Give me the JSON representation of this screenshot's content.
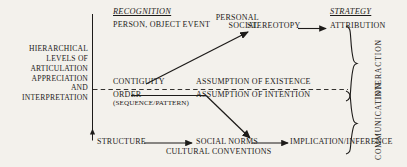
{
  "figure": {
    "headings": {
      "recognition": "RECOGNITION",
      "strategy": "STRATEGY"
    },
    "left_axis_label": "HIERARCHICAL\nLEVELS OF\nARTICULATION\nAPPRECIATION\nAND\nINTERPRETATION",
    "nodes": {
      "person_object_event": "PERSON, OBJECT EVENT",
      "personal_social": "PERSONAL\nSOCIAL",
      "stereotopy": "STEREOTOPY",
      "attribution": "ATTRIBUTION",
      "contiguity": "CONTIGUITY",
      "assumption_of_existence": "ASSUMPTION OF EXISTENCE",
      "order": "ORDER",
      "order_sub": "(SEQUENCE/PATTERN)",
      "assumption_of_intention": "ASSUMPTION OF INTENTION",
      "structure": "STRUCTURE",
      "social_norms": "SOCIAL NORMS",
      "cultural_conventions": "CULTURAL CONVENTIONS",
      "implication_inference": "IMPLICATION/INFERENCE"
    },
    "brace_labels": {
      "interaction": "INTERACTION",
      "communication": "COMMUNICATION"
    },
    "colors": {
      "ink": "#1d1b19",
      "paper": "#f3f1ec"
    }
  }
}
